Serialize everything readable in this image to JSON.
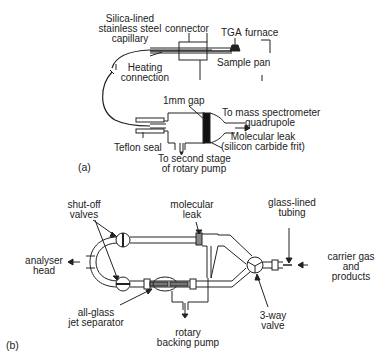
{
  "panel_a": {
    "tag": "(a)",
    "labels": {
      "capillary": [
        "Silica-lined",
        "stainless steel",
        "capillary"
      ],
      "connector": "connector",
      "tga": "TGA",
      "furnace": "furnace",
      "sample_pan": "Sample pan",
      "heating": [
        "Heating",
        "connection"
      ],
      "gap": "1mm gap",
      "mass_spec": [
        "To mass spectrometer",
        "quadrupole"
      ],
      "leak": [
        "Molecular leak",
        "(silicon carbide frit)"
      ],
      "teflon": "Teflon seal",
      "pump": [
        "To second stage",
        "of rotary pump"
      ]
    }
  },
  "panel_b": {
    "tag": "(b)",
    "labels": {
      "shutoff": [
        "shut-off",
        "valves"
      ],
      "mol_leak": [
        "molecular",
        "leak"
      ],
      "glass_tubing": [
        "glass-lined",
        "tubing"
      ],
      "analyser": [
        "analyser",
        "head"
      ],
      "carrier": [
        "carrier gas",
        "and",
        "products"
      ],
      "jet": [
        "all-glass",
        "jet separator"
      ],
      "three_way": [
        "3-way",
        "valve"
      ],
      "backing": [
        "rotary",
        "backing pump"
      ]
    }
  }
}
